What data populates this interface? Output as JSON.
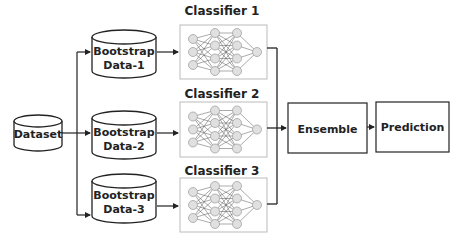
{
  "diagram": {
    "type": "bagging-ensemble-flow",
    "colors": {
      "stroke": "#222222",
      "classifier_border": "#bbbbbb",
      "node_fill": "#e0e0e0",
      "node_stroke": "#999999",
      "edge": "#555555"
    },
    "dataset": {
      "label": "Dataset"
    },
    "bootstraps": [
      {
        "line1": "Bootstrap",
        "line2": "Data-1"
      },
      {
        "line1": "Bootstrap",
        "line2": "Data-2"
      },
      {
        "line1": "Bootstrap",
        "line2": "Data-3"
      }
    ],
    "classifiers": [
      {
        "title": "Classifier 1",
        "icon": "neural-network-icon"
      },
      {
        "title": "Classifier 2",
        "icon": "neural-network-icon"
      },
      {
        "title": "Classifier 3",
        "icon": "neural-network-icon"
      }
    ],
    "ensemble": {
      "label": "Ensemble"
    },
    "prediction": {
      "label": "Prediction"
    }
  }
}
